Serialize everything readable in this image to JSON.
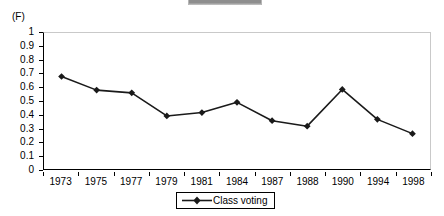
{
  "panel": {
    "label": "(F)"
  },
  "legend": {
    "entries": [
      {
        "label": "Class voting",
        "color": "#1a1a1a",
        "marker": "diamond"
      }
    ],
    "position": "bottom-center",
    "bordered": true
  },
  "axes": {
    "y_ticks": [
      "1",
      "0.9",
      "0.8",
      "0.7",
      "0.6",
      "0.5",
      "0.4",
      "0.3",
      "0.2",
      "0.1",
      "0"
    ],
    "x_ticks": [
      "1973",
      "1975",
      "1977",
      "1979",
      "1981",
      "1984",
      "1987",
      "1988",
      "1990",
      "1994",
      "1998"
    ]
  },
  "chart_data": {
    "type": "line",
    "title": "",
    "subtitle": "",
    "annotations": [
      "(F)"
    ],
    "xlabel": "",
    "ylabel": "",
    "categories": [
      "1973",
      "1975",
      "1977",
      "1979",
      "1981",
      "1984",
      "1987",
      "1988",
      "1990",
      "1994",
      "1998"
    ],
    "series": [
      {
        "name": "Class voting",
        "color": "#1a1a1a",
        "marker": "diamond",
        "values": [
          0.68,
          0.58,
          0.56,
          0.39,
          0.415,
          0.49,
          0.355,
          0.315,
          0.585,
          0.365,
          0.26
        ]
      }
    ],
    "ylim": [
      0,
      1
    ],
    "ytick_step": 0.1,
    "grid": false,
    "legend_position": "bottom-center"
  }
}
